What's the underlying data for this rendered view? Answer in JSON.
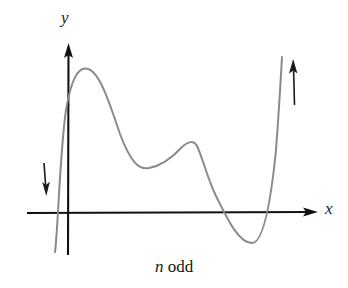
{
  "figure": {
    "caption_symbol": "n",
    "caption_word": "odd",
    "x_axis_label": "x",
    "y_axis_label": "y",
    "background_color": "#ffffff",
    "axis_color": "#111111",
    "curve_color": "#8a8a8a",
    "arrow_color": "#1a1a1a"
  },
  "chart_data": {
    "type": "line",
    "title": "",
    "subtitle": "n odd",
    "xlabel": "x",
    "ylabel": "y",
    "grid": false,
    "legend": "none",
    "annotations": [
      {
        "name": "left-end-behavior-arrow",
        "direction": "down",
        "meaning": "curve falls to negative infinity on the left",
        "x": 45,
        "y_start": 163,
        "y_end": 196
      },
      {
        "name": "right-end-behavior-arrow",
        "direction": "up",
        "meaning": "curve rises to positive infinity on the right",
        "x": 294,
        "y_start": 105,
        "y_end": 59
      }
    ],
    "axes": {
      "x_axis_y_pixel": 213,
      "y_axis_x_pixel": 68,
      "x_axis_from": 27,
      "x_axis_to": 318,
      "y_axis_from": 255,
      "y_axis_to": 43,
      "xlim": [
        27,
        318
      ],
      "ylim": [
        255,
        43
      ]
    },
    "features": [
      {
        "name": "left-x-intercept",
        "x": 62,
        "y": 213
      },
      {
        "name": "local-maximum-1",
        "x": 87,
        "y": 69
      },
      {
        "name": "local-minimum-1",
        "x": 148,
        "y": 168
      },
      {
        "name": "local-maximum-2",
        "x": 195,
        "y": 143
      },
      {
        "name": "x-intercept-2",
        "x": 240,
        "y": 213
      },
      {
        "name": "local-minimum-2",
        "x": 257,
        "y": 241
      },
      {
        "name": "x-intercept-3",
        "x": 270,
        "y": 213
      }
    ],
    "curve_path": "M 55,252 C 58,230 60,150 66,110 C 71,80 78,66 88,69 C 99,72 108,98 120,134 C 131,163 139,170 149,168 C 160,166 170,160 181,148 C 189,140 194,141 197,146 C 202,156 208,180 216,196 C 226,216 238,243 252,243 C 262,243 270,210 276,150 C 279,110 281,75 282,57"
  }
}
